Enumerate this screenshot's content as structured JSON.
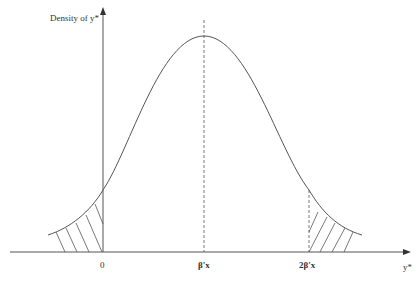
{
  "diagram": {
    "y_axis_label": "Density of y*",
    "x_axis_label": "y*",
    "ticks": [
      {
        "label": "0"
      },
      {
        "label": "β'x"
      },
      {
        "label": "2β'x"
      }
    ],
    "colors": {
      "line": "#555555",
      "text": "#333333"
    }
  }
}
